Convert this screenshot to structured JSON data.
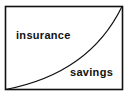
{
  "diagram": {
    "regions": [
      {
        "id": "upper-left",
        "label": "insurance"
      },
      {
        "id": "lower-right",
        "label": "savings"
      }
    ],
    "divider": {
      "type": "convex-curve",
      "from": "bottom-left",
      "to": "top-right"
    },
    "colors": {
      "stroke": "#111111",
      "background": "#ffffff",
      "text": "#111111"
    }
  }
}
